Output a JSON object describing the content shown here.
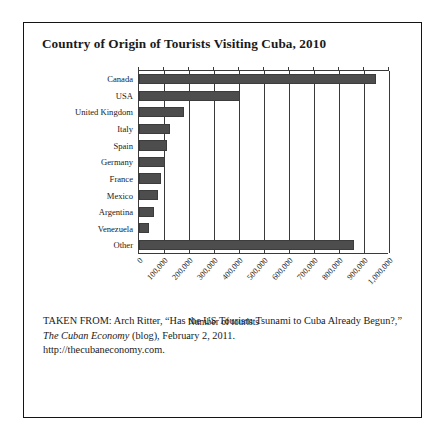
{
  "figure": {
    "title": "Country of Origin of Tourists Visiting Cuba, 2010",
    "axis_title": "Number of tourists",
    "caption": {
      "prefix": "TAKEN FROM: Arch Ritter, “Has the US Tourism Tsunami to Cuba Already Begun?,” ",
      "italic_source": "The Cuban Economy",
      "suffix": " (blog), February 2, 2011.",
      "url": "http://thecubaneconomy.com."
    },
    "colors": {
      "bar": "#4d4d4d",
      "axis": "#3a3a3a",
      "border": "#141414",
      "background": "#ffffff",
      "text": "#1a1a1a"
    }
  },
  "chart_data": {
    "type": "bar",
    "orientation": "horizontal",
    "title": "Country of Origin of Tourists Visiting Cuba, 2010",
    "xlabel": "Number of tourists",
    "ylabel": "",
    "xlim": [
      0,
      1000000
    ],
    "xticks": [
      0,
      100000,
      200000,
      300000,
      400000,
      500000,
      600000,
      700000,
      800000,
      900000,
      1000000
    ],
    "xtick_labels": [
      "0",
      "100,000",
      "200,000",
      "300,000",
      "400,000",
      "500,000",
      "600,000",
      "700,000",
      "800,000",
      "900,000",
      "1,000,000"
    ],
    "grid": "vertical",
    "legend": "none",
    "categories": [
      "Canada",
      "USA",
      "United Kingdom",
      "Italy",
      "Spain",
      "Germany",
      "France",
      "Mexico",
      "Argentina",
      "Venezuela",
      "Other"
    ],
    "values": [
      946000,
      405000,
      181000,
      125000,
      112000,
      105000,
      88000,
      75000,
      59000,
      41000,
      859000
    ],
    "series": [
      {
        "name": "Number of tourists",
        "values": [
          946000,
          405000,
          181000,
          125000,
          112000,
          105000,
          88000,
          75000,
          59000,
          41000,
          859000
        ]
      }
    ]
  }
}
